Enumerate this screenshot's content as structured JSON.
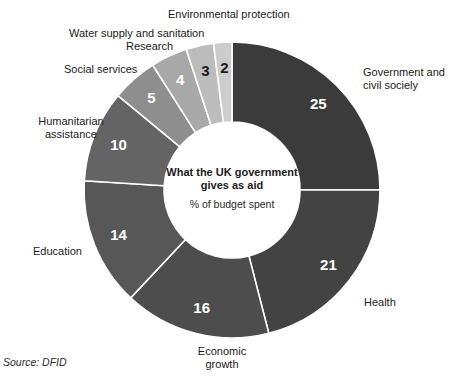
{
  "chart_data": {
    "type": "pie",
    "variant": "donut",
    "title": "What the UK government gives as aid",
    "subtitle": "% of budget spent",
    "unit": "%",
    "source": "Source: DFID",
    "start_angle_deg": 0,
    "direction": "clockwise",
    "total": 100,
    "categories": [
      "Government and civil sociely",
      "Health",
      "Economic growth",
      "Education",
      "Humanitarian assistance",
      "Social services",
      "Research",
      "Water supply and sanitation",
      "Environmental protection"
    ],
    "values": [
      25,
      21,
      16,
      14,
      10,
      5,
      4,
      3,
      2
    ],
    "colors": [
      "#3b3b3b",
      "#434343",
      "#4d4d4d",
      "#575757",
      "#646464",
      "#8e8e8e",
      "#a8a8a8",
      "#bcbcbc",
      "#cccccc"
    ],
    "value_label_colors": [
      "#ffffff",
      "#ffffff",
      "#ffffff",
      "#ffffff",
      "#ffffff",
      "#ffffff",
      "#ffffff",
      "#1a1a1a",
      "#1a1a1a"
    ],
    "slices": [
      {
        "label": "Government and civil sociely",
        "value": 25,
        "color": "#3b3b3b"
      },
      {
        "label": "Health",
        "value": 21,
        "color": "#434343"
      },
      {
        "label": "Economic growth",
        "value": 16,
        "color": "#4d4d4d"
      },
      {
        "label": "Education",
        "value": 14,
        "color": "#575757"
      },
      {
        "label": "Humanitarian assistance",
        "value": 10,
        "color": "#646464"
      },
      {
        "label": "Social services",
        "value": 5,
        "color": "#8e8e8e"
      },
      {
        "label": "Research",
        "value": 4,
        "color": "#a8a8a8"
      },
      {
        "label": "Water supply and sanitation",
        "value": 3,
        "color": "#bcbcbc"
      },
      {
        "label": "Environmental protection",
        "value": 2,
        "color": "#cccccc"
      }
    ],
    "legend": "outside-labels",
    "grid": false,
    "background": "#ffffff"
  },
  "center": {
    "title_line_1": "What the UK government",
    "title_line_2": "gives as aid",
    "subtitle": "% of budget spent"
  },
  "labels": {
    "environmental_protection": "Environmental protection",
    "water_supply": "Water supply and sanitation",
    "research": "Research",
    "social_services": "Social services",
    "humanitarian_line_1": "Humanitarian",
    "humanitarian_line_2": "assistance",
    "education": "Education",
    "government_line_1": "Government and",
    "government_line_2": "civil sociely",
    "health": "Health",
    "economic_line_1": "Economic",
    "economic_line_2": "growth"
  },
  "values_text": {
    "v25": "25",
    "v21": "21",
    "v16": "16",
    "v14": "14",
    "v10": "10",
    "v5": "5",
    "v4": "4",
    "v3": "3",
    "v2": "2"
  },
  "footer": {
    "source": "Source: DFID"
  }
}
